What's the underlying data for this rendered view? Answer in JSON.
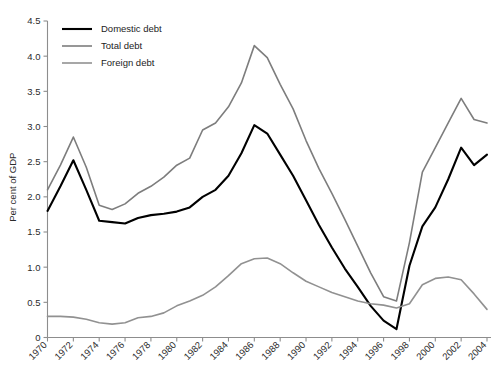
{
  "chart_data": {
    "type": "line",
    "title": "",
    "xlabel": "",
    "ylabel": "Per cent of GDP",
    "xlim": [
      1970,
      2004
    ],
    "ylim": [
      0,
      4.5
    ],
    "grid": false,
    "legend_position": "top-left",
    "x": [
      1970,
      1971,
      1972,
      1973,
      1974,
      1975,
      1976,
      1977,
      1978,
      1979,
      1980,
      1981,
      1982,
      1983,
      1984,
      1985,
      1986,
      1987,
      1988,
      1989,
      1990,
      1991,
      1992,
      1993,
      1994,
      1995,
      1996,
      1997,
      1998,
      1999,
      2000,
      2001,
      2002,
      2003,
      2004
    ],
    "xticks": [
      1970,
      1972,
      1974,
      1976,
      1978,
      1980,
      1982,
      1984,
      1986,
      1988,
      1990,
      1992,
      1994,
      1996,
      1998,
      2000,
      2002,
      2004
    ],
    "xticklabels": [
      "1970",
      "1972",
      "1974",
      "1976",
      "1978",
      "1980",
      "1982",
      "1984",
      "1986",
      "1988",
      "1990",
      "1992",
      "1994",
      "1996",
      "1998",
      "2000",
      "2002",
      "2004"
    ],
    "yticks": [
      0,
      0.5,
      1.0,
      1.5,
      2.0,
      2.5,
      3.0,
      3.5,
      4.0,
      4.5
    ],
    "yticklabels": [
      "0",
      "0.5",
      "1.0",
      "1.5",
      "2.0",
      "2.5",
      "3.0",
      "3.5",
      "4.0",
      "4.5"
    ],
    "series": [
      {
        "name": "Domestic debt",
        "color": "#000000",
        "width": 2.1,
        "values": [
          1.8,
          2.15,
          2.52,
          2.1,
          1.66,
          1.64,
          1.62,
          1.7,
          1.74,
          1.76,
          1.79,
          1.85,
          2.0,
          2.1,
          2.3,
          2.62,
          3.02,
          2.9,
          2.6,
          2.3,
          1.95,
          1.6,
          1.28,
          0.98,
          0.72,
          0.45,
          0.24,
          0.12,
          1.02,
          1.58,
          1.85,
          2.25,
          2.7,
          2.45,
          2.6
        ]
      },
      {
        "name": "Total debt",
        "color": "#7d7d7d",
        "width": 1.6,
        "values": [
          2.1,
          2.45,
          2.85,
          2.42,
          1.88,
          1.82,
          1.9,
          2.05,
          2.15,
          2.28,
          2.45,
          2.55,
          2.95,
          3.05,
          3.28,
          3.62,
          4.15,
          3.98,
          3.6,
          3.25,
          2.8,
          2.4,
          2.05,
          1.68,
          1.3,
          0.92,
          0.58,
          0.52,
          1.35,
          2.35,
          2.7,
          3.05,
          3.4,
          3.1,
          3.05
        ]
      },
      {
        "name": "Foreign debt",
        "color": "#919191",
        "width": 1.6,
        "values": [
          0.3,
          0.3,
          0.29,
          0.26,
          0.21,
          0.19,
          0.21,
          0.28,
          0.3,
          0.35,
          0.45,
          0.52,
          0.6,
          0.72,
          0.88,
          1.05,
          1.12,
          1.13,
          1.05,
          0.92,
          0.8,
          0.72,
          0.64,
          0.58,
          0.52,
          0.48,
          0.46,
          0.42,
          0.48,
          0.75,
          0.84,
          0.86,
          0.82,
          0.62,
          0.4
        ]
      }
    ]
  },
  "legend": {
    "items": [
      {
        "label": "Domestic debt"
      },
      {
        "label": "Total debt"
      },
      {
        "label": "Foreign debt"
      }
    ]
  },
  "axes": {
    "y_title": "Per cent of GDP"
  }
}
